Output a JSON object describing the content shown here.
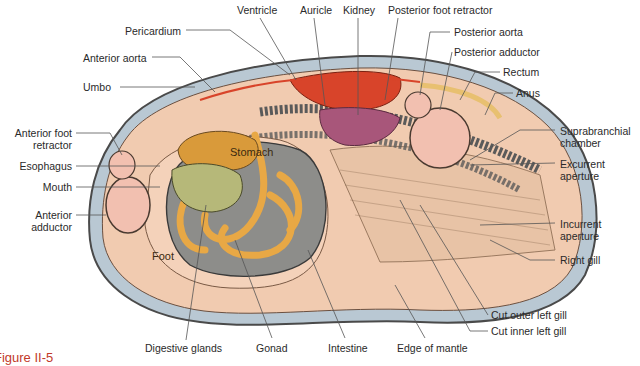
{
  "diagram": {
    "colors": {
      "shell": "#b9c8d3",
      "mantle": "#f1cbb0",
      "foot": "#f4d2ba",
      "muscle": "#f2c0b0",
      "heart": "#d8442a",
      "kidney": "#a8567a",
      "stomach": "#d99a3a",
      "digestive_glands": "#b6b879",
      "gonad": "#8d8d8a",
      "intestine": "#e8a845",
      "caption": "#c23a2a"
    },
    "organ_labels": {
      "stomach": "Stomach",
      "foot": "Foot"
    },
    "labels": {
      "ventricle": "Ventricle",
      "auricle": "Auricle",
      "kidney": "Kidney",
      "posterior_foot_retractor": "Posterior foot retractor",
      "pericardium": "Pericardium",
      "posterior_aorta": "Posterior aorta",
      "anterior_aorta": "Anterior aorta",
      "posterior_adductor": "Posterior adductor",
      "umbo": "Umbo",
      "rectum": "Rectum",
      "anus": "Anus",
      "anterior_foot_retractor_1": "Anterior foot",
      "anterior_foot_retractor_2": "retractor",
      "esophagus": "Esophagus",
      "mouth": "Mouth",
      "anterior_adductor_1": "Anterior",
      "anterior_adductor_2": "adductor",
      "suprabranchial_1": "Suprabranchial",
      "suprabranchial_2": "chamber",
      "excurrent_1": "Excurrent",
      "excurrent_2": "aperture",
      "incurrent_1": "Incurrent",
      "incurrent_2": "aperture",
      "right_gill": "Right gill",
      "cut_outer_left_gill": "Cut outer left gill",
      "cut_inner_left_gill": "Cut inner left gill",
      "digestive_glands": "Digestive glands",
      "gonad": "Gonad",
      "intestine": "Intestine",
      "edge_of_mantle": "Edge of mantle"
    },
    "caption": "Figure II-5"
  }
}
